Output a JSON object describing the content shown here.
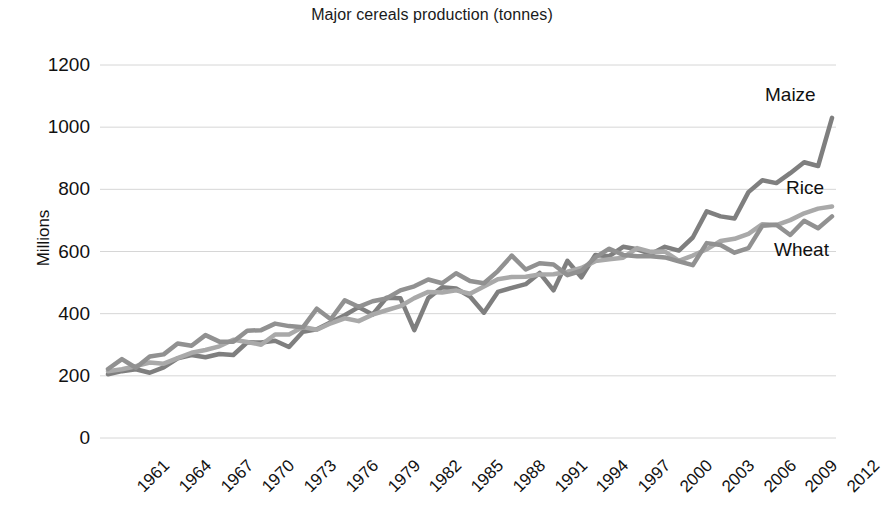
{
  "chart_data": {
    "type": "line",
    "title": "Major cereals production (tonnes)",
    "xlabel": "",
    "ylabel": "Millions",
    "ylim": [
      0,
      1200
    ],
    "ytick_step": 200,
    "yticks": [
      "1200",
      "1000",
      "800",
      "600",
      "400",
      "200",
      "0"
    ],
    "grid": true,
    "grid_axis": "y",
    "legend_position": "inline-right",
    "x": [
      1961,
      1962,
      1963,
      1964,
      1965,
      1966,
      1967,
      1968,
      1969,
      1970,
      1971,
      1972,
      1973,
      1974,
      1975,
      1976,
      1977,
      1978,
      1979,
      1980,
      1981,
      1982,
      1983,
      1984,
      1985,
      1986,
      1987,
      1988,
      1989,
      1990,
      1991,
      1992,
      1993,
      1994,
      1995,
      1996,
      1997,
      1998,
      1999,
      2000,
      2001,
      2002,
      2003,
      2004,
      2005,
      2006,
      2007,
      2008,
      2009,
      2010,
      2011,
      2012,
      2013
    ],
    "xticks": [
      "1961",
      "1964",
      "1967",
      "1970",
      "1973",
      "1976",
      "1979",
      "1982",
      "1985",
      "1988",
      "1991",
      "1994",
      "1997",
      "2000",
      "2003",
      "2006",
      "2009",
      "2012"
    ],
    "xtick_step": 3,
    "series": [
      {
        "name": "Maize",
        "color": "#7f7f7f",
        "values": [
          205,
          215,
          221,
          210,
          227,
          256,
          267,
          260,
          270,
          267,
          308,
          307,
          313,
          293,
          342,
          350,
          372,
          395,
          421,
          397,
          451,
          450,
          347,
          450,
          485,
          481,
          455,
          403,
          470,
          483,
          495,
          531,
          475,
          570,
          517,
          589,
          585,
          615,
          607,
          592,
          615,
          603,
          645,
          729,
          713,
          706,
          791,
          829,
          820,
          852,
          887,
          875,
          1030
        ]
      },
      {
        "name": "Rice",
        "color": "#a9a9a9",
        "values": [
          215,
          221,
          231,
          243,
          239,
          257,
          274,
          283,
          295,
          316,
          309,
          300,
          333,
          333,
          357,
          348,
          369,
          385,
          376,
          397,
          411,
          424,
          450,
          470,
          468,
          475,
          464,
          487,
          511,
          518,
          519,
          526,
          527,
          535,
          547,
          569,
          575,
          580,
          611,
          599,
          600,
          570,
          587,
          607,
          634,
          641,
          657,
          688,
          685,
          701,
          723,
          738,
          745
        ]
      },
      {
        "name": "Wheat",
        "color": "#919191",
        "values": [
          222,
          254,
          226,
          262,
          269,
          304,
          297,
          331,
          310,
          310,
          345,
          347,
          368,
          360,
          356,
          416,
          382,
          443,
          422,
          440,
          449,
          475,
          488,
          510,
          498,
          530,
          505,
          498,
          537,
          587,
          542,
          562,
          558,
          524,
          538,
          581,
          609,
          589,
          585,
          585,
          581,
          568,
          556,
          627,
          621,
          596,
          611,
          683,
          686,
          653,
          699,
          675,
          713
        ]
      }
    ],
    "series_labels": [
      {
        "name": "Maize",
        "text": "Maize"
      },
      {
        "name": "Rice",
        "text": "Rice"
      },
      {
        "name": "Wheat",
        "text": "Wheat"
      }
    ]
  }
}
